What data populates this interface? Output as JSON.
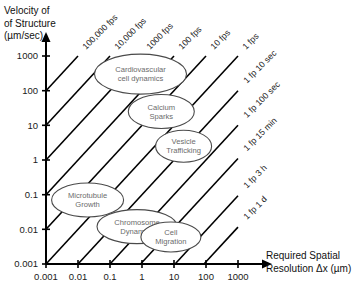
{
  "chart_data": {
    "type": "line",
    "title": "",
    "xlabel": "Required Spatial Resolution Δx (µm)",
    "ylabel_line1": "Velocity of",
    "ylabel_line2": "of Structure",
    "ylabel_line3": "(µm/sec)",
    "xscale": "log",
    "yscale": "log",
    "xlim": [
      0.001,
      3000
    ],
    "ylim": [
      0.001,
      3000
    ],
    "xticks": [
      "0.001",
      "0.01",
      "0.1",
      "1",
      "10",
      "100",
      "1000"
    ],
    "xtick_values": [
      0.001,
      0.01,
      0.1,
      1,
      10,
      100,
      1000
    ],
    "yticks": [
      "1000",
      "100",
      "10",
      "1",
      "0.1",
      "0.01",
      "0.001"
    ],
    "ytick_values": [
      1000,
      100,
      10,
      1,
      0.1,
      0.01,
      0.001
    ],
    "grid": false,
    "legend": "none",
    "iso_lines_note": "Diagonal lines of constant frame rate: velocity = spatial resolution x frame rate",
    "iso_lines": [
      {
        "label": "100,000 fps",
        "rate_hz": 100000,
        "label_rotation_deg": -45
      },
      {
        "label": "10,000 fps",
        "rate_hz": 10000,
        "label_rotation_deg": -45
      },
      {
        "label": "1000 fps",
        "rate_hz": 1000,
        "label_rotation_deg": -45
      },
      {
        "label": "100 fps",
        "rate_hz": 100,
        "label_rotation_deg": -45
      },
      {
        "label": "10 fps",
        "rate_hz": 10,
        "label_rotation_deg": -45
      },
      {
        "label": "1 fps",
        "rate_hz": 1,
        "label_rotation_deg": -45
      },
      {
        "label": "1 fp 10 sec",
        "rate_hz": 0.1,
        "label_rotation_deg": -45
      },
      {
        "label": "1 fp 100 sec",
        "rate_hz": 0.01,
        "label_rotation_deg": -45
      },
      {
        "label": "1 fp 15 min",
        "rate_hz": 0.00111,
        "label_rotation_deg": -45
      },
      {
        "label": "1 fp 3 h",
        "rate_hz": 9.26e-05,
        "label_rotation_deg": -45
      },
      {
        "label": "1 fp 1 d",
        "rate_hz": 1.16e-05,
        "label_rotation_deg": -45
      }
    ],
    "annotations": [
      {
        "label": "Cardiovascular cell dynamics",
        "lines": [
          "Cardiovascular",
          "cell dynamics"
        ],
        "x": 0.9,
        "y": 300,
        "rx": 46,
        "ry": 20
      },
      {
        "label": "Calcium Sparks",
        "lines": [
          "Calcium",
          "Sparks"
        ],
        "x": 4.0,
        "y": 25,
        "rx": 33,
        "ry": 17
      },
      {
        "label": "Vesicle Trafficking",
        "lines": [
          "Vesicle",
          "Trafficking"
        ],
        "x": 20,
        "y": 2.5,
        "rx": 28,
        "ry": 16
      },
      {
        "label": "Microtubule Growth",
        "lines": [
          "Microtubule",
          "Growth"
        ],
        "x": 0.02,
        "y": 0.07,
        "rx": 36,
        "ry": 17
      },
      {
        "label": "Chromosome Dynamics",
        "lines": [
          "Chromosome",
          "Dynamics"
        ],
        "x": 0.7,
        "y": 0.012,
        "rx": 40,
        "ry": 17
      },
      {
        "label": "Cell Migration",
        "lines": [
          "Cell",
          "Migration"
        ],
        "x": 8,
        "y": 0.006,
        "rx": 30,
        "ry": 15
      }
    ]
  },
  "axes": {
    "x_title": "Required Spatial Resolution Δx (µm)",
    "x_title_line1": "Required Spatial",
    "x_title_line2": "Resolution Δx (µm)",
    "y_title_line1": "Velocity of",
    "y_title_line2": "of Structure",
    "y_title_line3": "(µm/sec)"
  },
  "colors": {
    "background": "#ffffff",
    "axis": "#000000",
    "diagonal_line": "#000000",
    "bubble_stroke": "#4a4a4a",
    "bubble_fill": "#ffffff",
    "bubble_text": "#6b6b6b",
    "tick_text": "#1a1a1a"
  }
}
